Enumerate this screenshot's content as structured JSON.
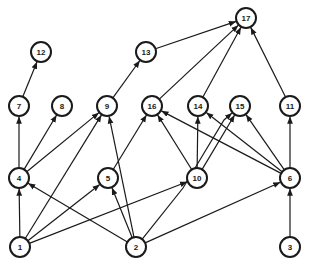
{
  "diagram": {
    "type": "directed-acyclic-graph",
    "node_radius": 10,
    "nodes": [
      {
        "id": "1",
        "label": "1",
        "x": 20,
        "y": 247
      },
      {
        "id": "2",
        "label": "2",
        "x": 136,
        "y": 247
      },
      {
        "id": "3",
        "label": "3",
        "x": 290,
        "y": 247
      },
      {
        "id": "4",
        "label": "4",
        "x": 19,
        "y": 178
      },
      {
        "id": "5",
        "label": "5",
        "x": 108,
        "y": 178
      },
      {
        "id": "10",
        "label": "10",
        "x": 197,
        "y": 178
      },
      {
        "id": "6",
        "label": "6",
        "x": 290,
        "y": 178
      },
      {
        "id": "7",
        "label": "7",
        "x": 19,
        "y": 106
      },
      {
        "id": "8",
        "label": "8",
        "x": 62,
        "y": 106
      },
      {
        "id": "9",
        "label": "9",
        "x": 107,
        "y": 106
      },
      {
        "id": "16",
        "label": "16",
        "x": 152,
        "y": 106
      },
      {
        "id": "14",
        "label": "14",
        "x": 198,
        "y": 106
      },
      {
        "id": "15",
        "label": "15",
        "x": 240,
        "y": 106
      },
      {
        "id": "11",
        "label": "11",
        "x": 290,
        "y": 106
      },
      {
        "id": "12",
        "label": "12",
        "x": 41,
        "y": 52
      },
      {
        "id": "13",
        "label": "13",
        "x": 146,
        "y": 52
      },
      {
        "id": "17",
        "label": "17",
        "x": 246,
        "y": 18
      }
    ],
    "edges": [
      {
        "from": "1",
        "to": "4"
      },
      {
        "from": "1",
        "to": "5"
      },
      {
        "from": "1",
        "to": "9"
      },
      {
        "from": "1",
        "to": "10"
      },
      {
        "from": "2",
        "to": "4"
      },
      {
        "from": "2",
        "to": "5"
      },
      {
        "from": "2",
        "to": "9"
      },
      {
        "from": "2",
        "to": "6"
      },
      {
        "from": "2",
        "to": "15",
        "via": [
          [
            183,
            188
          ],
          [
            224,
            120
          ]
        ]
      },
      {
        "from": "3",
        "to": "6"
      },
      {
        "from": "4",
        "to": "7"
      },
      {
        "from": "4",
        "to": "8"
      },
      {
        "from": "4",
        "to": "9"
      },
      {
        "from": "7",
        "to": "12"
      },
      {
        "from": "9",
        "to": "13"
      },
      {
        "from": "5",
        "to": "16"
      },
      {
        "from": "10",
        "to": "16"
      },
      {
        "from": "10",
        "to": "14"
      },
      {
        "from": "10",
        "to": "15"
      },
      {
        "from": "6",
        "to": "16"
      },
      {
        "from": "6",
        "to": "14"
      },
      {
        "from": "6",
        "to": "15"
      },
      {
        "from": "6",
        "to": "11"
      },
      {
        "from": "13",
        "to": "17"
      },
      {
        "from": "16",
        "to": "17"
      },
      {
        "from": "14",
        "to": "17"
      },
      {
        "from": "11",
        "to": "17"
      }
    ]
  }
}
